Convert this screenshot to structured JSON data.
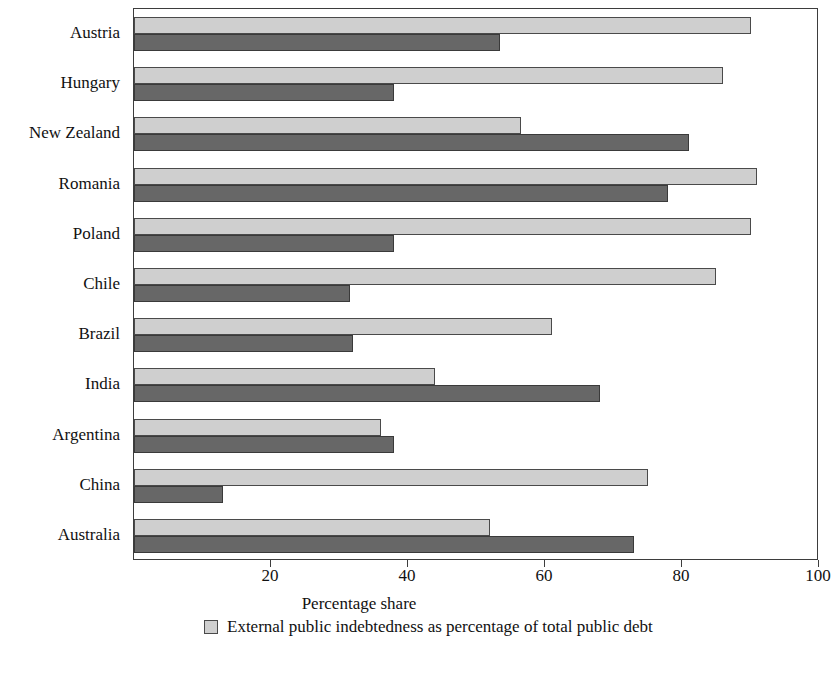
{
  "chart_data": {
    "type": "bar",
    "orientation": "horizontal",
    "title": "",
    "xlabel": "Percentage share",
    "ylabel": "",
    "xlim": [
      0,
      100
    ],
    "xticks": [
      0,
      20,
      40,
      60,
      80,
      100
    ],
    "xticklabels": [
      "",
      "20",
      "40",
      "60",
      "80",
      "100"
    ],
    "grid": false,
    "legend_position": "below",
    "categories": [
      "Austria",
      "Hungary",
      "New Zealand",
      "Romania",
      "Poland",
      "Chile",
      "Brazil",
      "India",
      "Argentina",
      "China",
      "Australia"
    ],
    "series": [
      {
        "name": "External public indebtedness as percentage of total public debt",
        "color": "#cfcfcf",
        "values": [
          90,
          86,
          56.5,
          91,
          90,
          85,
          61,
          44,
          36,
          75,
          52
        ]
      },
      {
        "name": "Second series",
        "color": "#676767",
        "values": [
          53.5,
          38,
          81,
          78,
          38,
          31.5,
          32,
          68,
          38,
          13,
          73
        ]
      }
    ]
  },
  "axis": {
    "x_title": "Percentage share",
    "tick_labels": [
      "20",
      "40",
      "60",
      "80",
      "100"
    ],
    "tick_values": [
      20,
      40,
      60,
      80,
      100
    ]
  },
  "legend": {
    "items": [
      {
        "label": "External public indebtedness as percentage of total public debt",
        "swatch": "light-grey-swatch"
      }
    ]
  }
}
